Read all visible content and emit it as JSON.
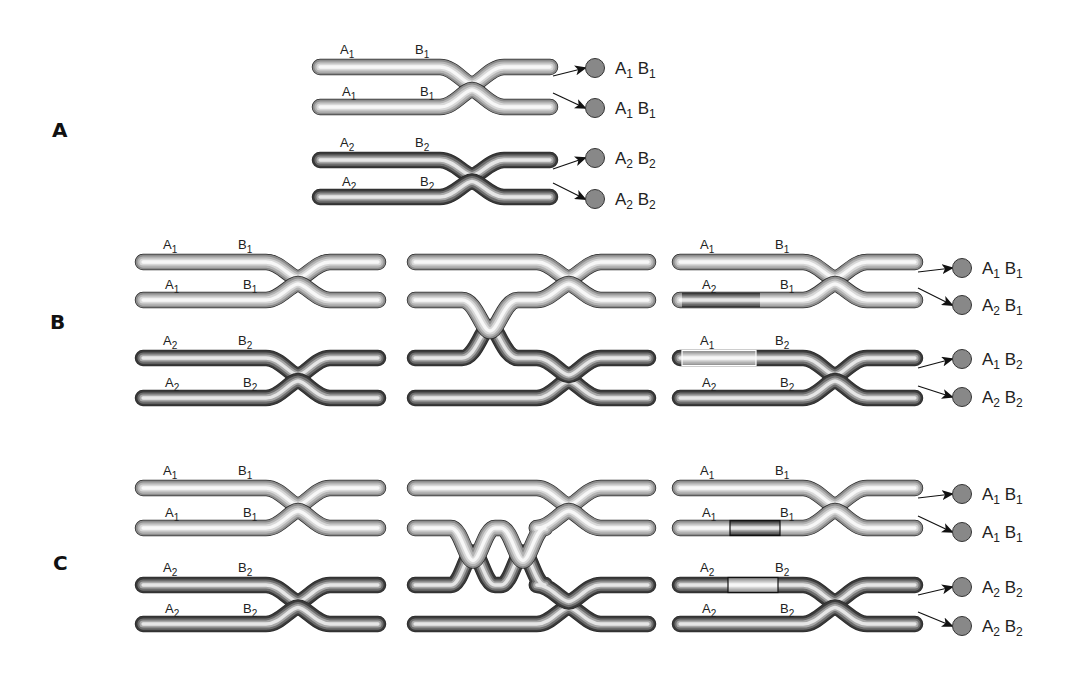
{
  "figure": {
    "type": "meiosis-crossing-over-diagram",
    "colors": {
      "light_chromosome": "#c8c8c8",
      "dark_chromosome": "#5a5a5a",
      "gamete_fill": "#888888",
      "text": "#222222"
    }
  },
  "sections": [
    {
      "id": "A",
      "label": "A",
      "stages": [
        {
          "name": "final",
          "chromosomes": [
            {
              "shade": "light",
              "alleles": [
                "A1",
                "B1"
              ],
              "labels": [
                {
                  "base": "A",
                  "sub": "1"
                },
                {
                  "base": "B",
                  "sub": "1"
                }
              ]
            },
            {
              "shade": "light",
              "alleles": [
                "A1",
                "B1"
              ],
              "labels": [
                {
                  "base": "A",
                  "sub": "1"
                },
                {
                  "base": "B",
                  "sub": "1"
                }
              ]
            },
            {
              "shade": "dark",
              "alleles": [
                "A2",
                "B2"
              ],
              "labels": [
                {
                  "base": "A",
                  "sub": "2"
                },
                {
                  "base": "B",
                  "sub": "2"
                }
              ]
            },
            {
              "shade": "dark",
              "alleles": [
                "A2",
                "B2"
              ],
              "labels": [
                {
                  "base": "A",
                  "sub": "2"
                },
                {
                  "base": "B",
                  "sub": "2"
                }
              ]
            }
          ]
        }
      ],
      "gametes": [
        {
          "a": {
            "base": "A",
            "sub": "1"
          },
          "b": {
            "base": "B",
            "sub": "1"
          }
        },
        {
          "a": {
            "base": "A",
            "sub": "1"
          },
          "b": {
            "base": "B",
            "sub": "1"
          }
        },
        {
          "a": {
            "base": "A",
            "sub": "2"
          },
          "b": {
            "base": "B",
            "sub": "2"
          }
        },
        {
          "a": {
            "base": "A",
            "sub": "2"
          },
          "b": {
            "base": "B",
            "sub": "2"
          }
        }
      ]
    },
    {
      "id": "B",
      "label": "B",
      "stages": [
        {
          "name": "before",
          "chromosomes": [
            {
              "shade": "light",
              "labels": [
                {
                  "base": "A",
                  "sub": "1"
                },
                {
                  "base": "B",
                  "sub": "1"
                }
              ]
            },
            {
              "shade": "light",
              "labels": [
                {
                  "base": "A",
                  "sub": "1"
                },
                {
                  "base": "B",
                  "sub": "1"
                }
              ]
            },
            {
              "shade": "dark",
              "labels": [
                {
                  "base": "A",
                  "sub": "2"
                },
                {
                  "base": "B",
                  "sub": "2"
                }
              ]
            },
            {
              "shade": "dark",
              "labels": [
                {
                  "base": "A",
                  "sub": "2"
                },
                {
                  "base": "B",
                  "sub": "2"
                }
              ]
            }
          ]
        },
        {
          "name": "single-crossover",
          "crossovers": 1
        },
        {
          "name": "after",
          "chromosomes": [
            {
              "shade": "light",
              "labels": [
                {
                  "base": "A",
                  "sub": "1"
                },
                {
                  "base": "B",
                  "sub": "1"
                }
              ]
            },
            {
              "shade": "mixed-dark-left",
              "labels": [
                {
                  "base": "A",
                  "sub": "2"
                },
                {
                  "base": "B",
                  "sub": "1"
                }
              ]
            },
            {
              "shade": "mixed-light-left",
              "labels": [
                {
                  "base": "A",
                  "sub": "1"
                },
                {
                  "base": "B",
                  "sub": "2"
                }
              ]
            },
            {
              "shade": "dark",
              "labels": [
                {
                  "base": "A",
                  "sub": "2"
                },
                {
                  "base": "B",
                  "sub": "2"
                }
              ]
            }
          ]
        }
      ],
      "gametes": [
        {
          "a": {
            "base": "A",
            "sub": "1"
          },
          "b": {
            "base": "B",
            "sub": "1"
          }
        },
        {
          "a": {
            "base": "A",
            "sub": "2"
          },
          "b": {
            "base": "B",
            "sub": "1"
          }
        },
        {
          "a": {
            "base": "A",
            "sub": "1"
          },
          "b": {
            "base": "B",
            "sub": "2"
          }
        },
        {
          "a": {
            "base": "A",
            "sub": "2"
          },
          "b": {
            "base": "B",
            "sub": "2"
          }
        }
      ]
    },
    {
      "id": "C",
      "label": "C",
      "stages": [
        {
          "name": "before",
          "chromosomes": [
            {
              "shade": "light",
              "labels": [
                {
                  "base": "A",
                  "sub": "1"
                },
                {
                  "base": "B",
                  "sub": "1"
                }
              ]
            },
            {
              "shade": "light",
              "labels": [
                {
                  "base": "A",
                  "sub": "1"
                },
                {
                  "base": "B",
                  "sub": "1"
                }
              ]
            },
            {
              "shade": "dark",
              "labels": [
                {
                  "base": "A",
                  "sub": "2"
                },
                {
                  "base": "B",
                  "sub": "2"
                }
              ]
            },
            {
              "shade": "dark",
              "labels": [
                {
                  "base": "A",
                  "sub": "2"
                },
                {
                  "base": "B",
                  "sub": "2"
                }
              ]
            }
          ]
        },
        {
          "name": "double-crossover",
          "crossovers": 2
        },
        {
          "name": "after",
          "chromosomes": [
            {
              "shade": "light",
              "labels": [
                {
                  "base": "A",
                  "sub": "1"
                },
                {
                  "base": "B",
                  "sub": "1"
                }
              ]
            },
            {
              "shade": "light-with-dark-middle",
              "labels": [
                {
                  "base": "A",
                  "sub": "1"
                },
                {
                  "base": "B",
                  "sub": "1"
                }
              ]
            },
            {
              "shade": "dark-with-light-middle",
              "labels": [
                {
                  "base": "A",
                  "sub": "2"
                },
                {
                  "base": "B",
                  "sub": "2"
                }
              ]
            },
            {
              "shade": "dark",
              "labels": [
                {
                  "base": "A",
                  "sub": "2"
                },
                {
                  "base": "B",
                  "sub": "2"
                }
              ]
            }
          ]
        }
      ],
      "gametes": [
        {
          "a": {
            "base": "A",
            "sub": "1"
          },
          "b": {
            "base": "B",
            "sub": "1"
          }
        },
        {
          "a": {
            "base": "A",
            "sub": "1"
          },
          "b": {
            "base": "B",
            "sub": "1"
          }
        },
        {
          "a": {
            "base": "A",
            "sub": "2"
          },
          "b": {
            "base": "B",
            "sub": "2"
          }
        },
        {
          "a": {
            "base": "A",
            "sub": "2"
          },
          "b": {
            "base": "B",
            "sub": "2"
          }
        }
      ]
    }
  ]
}
